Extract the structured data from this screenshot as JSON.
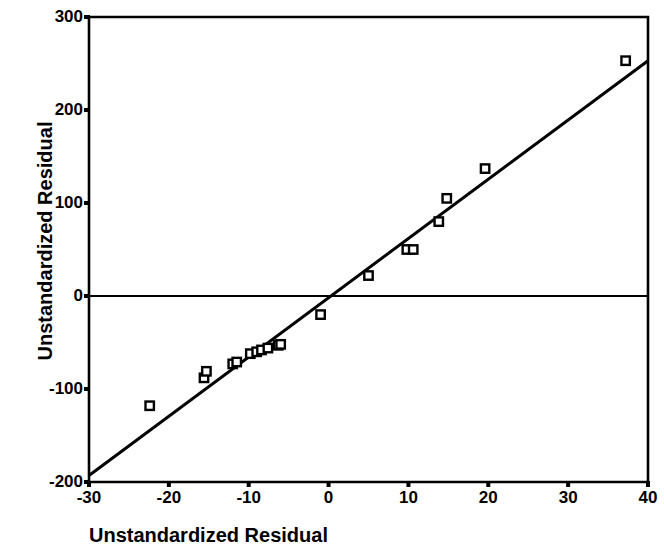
{
  "chart_data": {
    "type": "scatter",
    "title": "",
    "xlabel": "Unstandardized Residual",
    "ylabel": "Unstandardized Residual",
    "xlim": [
      -30,
      40
    ],
    "ylim": [
      -200,
      300
    ],
    "xticks": [
      -30,
      -20,
      -10,
      0,
      10,
      20,
      30,
      40
    ],
    "xtick_labels": [
      "-30",
      "-20",
      "-10",
      "0",
      "10",
      "20",
      "30",
      "40"
    ],
    "yticks": [
      -200,
      -100,
      0,
      100,
      200,
      300
    ],
    "ytick_labels": [
      "-200",
      "-100",
      "0",
      "100",
      "200",
      "300"
    ],
    "grid": false,
    "legend": null,
    "marker": "open-square",
    "marker_color": "#000000",
    "line_color": "#000000",
    "zero_line": 0,
    "points": [
      {
        "x": -22.4,
        "y": -118
      },
      {
        "x": -15.6,
        "y": -88
      },
      {
        "x": -15.3,
        "y": -81
      },
      {
        "x": -12.0,
        "y": -73
      },
      {
        "x": -11.5,
        "y": -71
      },
      {
        "x": -9.8,
        "y": -62
      },
      {
        "x": -9.0,
        "y": -60
      },
      {
        "x": -8.4,
        "y": -58
      },
      {
        "x": -7.6,
        "y": -56
      },
      {
        "x": -6.3,
        "y": -53
      },
      {
        "x": -6.0,
        "y": -52
      },
      {
        "x": -1.0,
        "y": -20
      },
      {
        "x": 5.0,
        "y": 22
      },
      {
        "x": 9.8,
        "y": 50
      },
      {
        "x": 10.6,
        "y": 50
      },
      {
        "x": 13.8,
        "y": 80
      },
      {
        "x": 14.8,
        "y": 105
      },
      {
        "x": 19.6,
        "y": 137
      },
      {
        "x": 37.2,
        "y": 253
      }
    ],
    "fit_line": {
      "x_start": -30,
      "y_start": -193,
      "x_end": 40,
      "y_end": 253
    }
  },
  "axes": {
    "y_title": "Unstandardized Residual",
    "x_title": "Unstandardized Residual",
    "y_ticks": [
      {
        "label": "300",
        "value": 300
      },
      {
        "label": "200",
        "value": 200
      },
      {
        "label": "100",
        "value": 100
      },
      {
        "label": "0",
        "value": 0
      },
      {
        "label": "-100",
        "value": -100
      },
      {
        "label": "-200",
        "value": -200
      }
    ],
    "x_ticks": [
      {
        "label": "-30",
        "value": -30
      },
      {
        "label": "-20",
        "value": -20
      },
      {
        "label": "-10",
        "value": -10
      },
      {
        "label": "0",
        "value": 0
      },
      {
        "label": "10",
        "value": 10
      },
      {
        "label": "20",
        "value": 20
      },
      {
        "label": "30",
        "value": 30
      },
      {
        "label": "40",
        "value": 40
      }
    ]
  }
}
